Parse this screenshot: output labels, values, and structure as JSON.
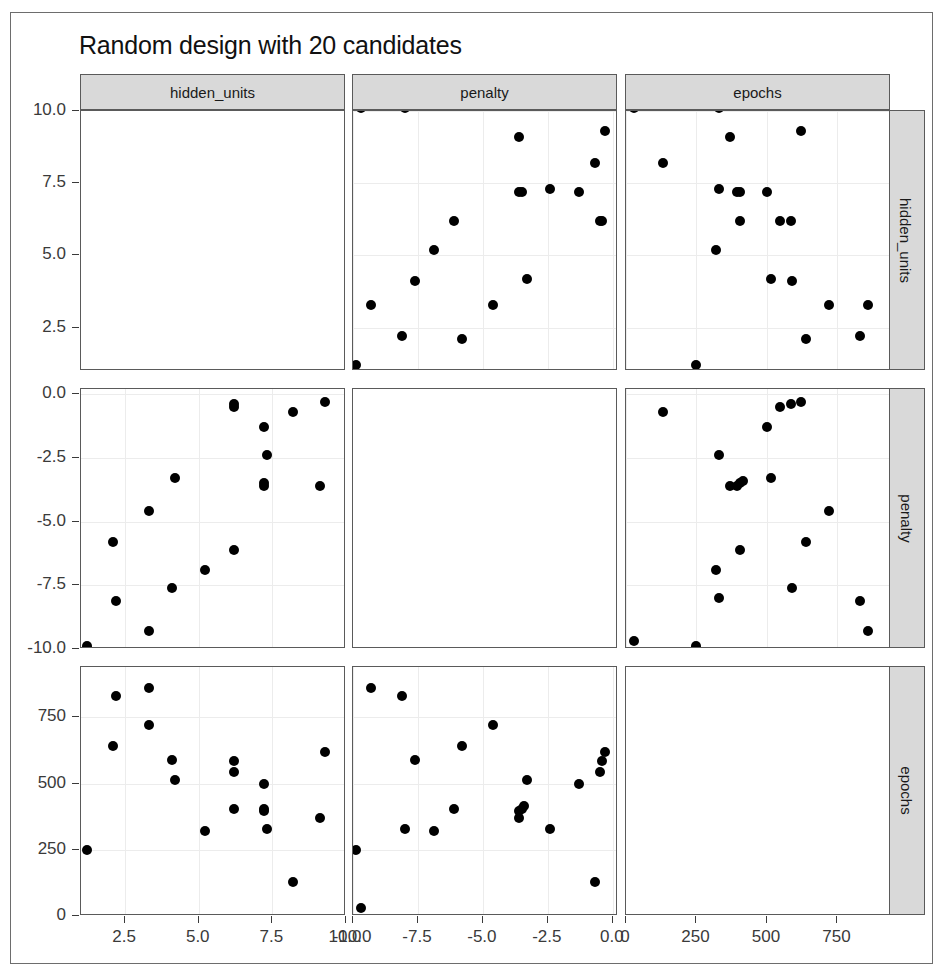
{
  "chart_data": {
    "type": "scatter",
    "title": "Random design with 20 candidates",
    "subtitle": "",
    "layout": "pairs-matrix",
    "grid": true,
    "legend": "none",
    "variables": [
      "hidden_units",
      "penalty",
      "epochs"
    ],
    "column_strips": [
      "hidden_units",
      "penalty",
      "epochs"
    ],
    "row_strips": [
      "hidden_units",
      "penalty",
      "epochs"
    ],
    "axes": {
      "hidden_units": {
        "label": "hidden_units",
        "lim": [
          1,
          10
        ],
        "ticks": [
          2.5,
          5.0,
          7.5,
          10.0
        ],
        "tick_labels": [
          "2.5",
          "5.0",
          "7.5",
          "10.0"
        ]
      },
      "penalty": {
        "label": "penalty",
        "lim": [
          -10,
          0.2
        ],
        "ticks": [
          -10.0,
          -7.5,
          -5.0,
          -2.5,
          0.0
        ],
        "tick_labels": [
          "-10.0",
          "-7.5",
          "-5.0",
          "-2.5",
          "0.0"
        ]
      },
      "epochs": {
        "label": "epochs",
        "lim": [
          0,
          940
        ],
        "ticks": [
          0,
          250,
          500,
          750
        ],
        "tick_labels": [
          "0",
          "250",
          "500",
          "750"
        ]
      }
    },
    "n_points": 20,
    "points": [
      {
        "hidden_units": 10.1,
        "penalty": -9.7,
        "epochs": 30
      },
      {
        "hidden_units": 10.1,
        "penalty": -8.0,
        "epochs": 330
      },
      {
        "hidden_units": 9.1,
        "penalty": -3.6,
        "epochs": 370
      },
      {
        "hidden_units": 10.2,
        "penalty": -3.4,
        "epochs": 415
      },
      {
        "hidden_units": 9.3,
        "penalty": -0.3,
        "epochs": 620
      },
      {
        "hidden_units": 8.2,
        "penalty": -0.7,
        "epochs": 130
      },
      {
        "hidden_units": 7.2,
        "penalty": -3.6,
        "epochs": 395
      },
      {
        "hidden_units": 7.2,
        "penalty": -3.5,
        "epochs": 405
      },
      {
        "hidden_units": 7.3,
        "penalty": -2.4,
        "epochs": 330
      },
      {
        "hidden_units": 7.2,
        "penalty": -1.3,
        "epochs": 500
      },
      {
        "hidden_units": 6.2,
        "penalty": -6.1,
        "epochs": 405
      },
      {
        "hidden_units": 6.2,
        "penalty": -0.5,
        "epochs": 545
      },
      {
        "hidden_units": 6.2,
        "penalty": -0.4,
        "epochs": 585
      },
      {
        "hidden_units": 5.2,
        "penalty": -6.9,
        "epochs": 320
      },
      {
        "hidden_units": 4.2,
        "penalty": -3.3,
        "epochs": 515
      },
      {
        "hidden_units": 4.1,
        "penalty": -7.6,
        "epochs": 590
      },
      {
        "hidden_units": 3.3,
        "penalty": -4.6,
        "epochs": 720
      },
      {
        "hidden_units": 3.3,
        "penalty": -9.3,
        "epochs": 860
      },
      {
        "hidden_units": 2.2,
        "penalty": -8.1,
        "epochs": 830
      },
      {
        "hidden_units": 2.1,
        "penalty": -5.8,
        "epochs": 640
      },
      {
        "hidden_units": 1.2,
        "penalty": -9.9,
        "epochs": 250
      }
    ],
    "panels": [
      {
        "row": 0,
        "col": 0,
        "x": "hidden_units",
        "y": "hidden_units",
        "blank": true
      },
      {
        "row": 0,
        "col": 1,
        "x": "penalty",
        "y": "hidden_units",
        "blank": false
      },
      {
        "row": 0,
        "col": 2,
        "x": "epochs",
        "y": "hidden_units",
        "blank": false
      },
      {
        "row": 1,
        "col": 0,
        "x": "hidden_units",
        "y": "penalty",
        "blank": false
      },
      {
        "row": 1,
        "col": 1,
        "x": "penalty",
        "y": "penalty",
        "blank": true
      },
      {
        "row": 1,
        "col": 2,
        "x": "epochs",
        "y": "penalty",
        "blank": false
      },
      {
        "row": 2,
        "col": 0,
        "x": "hidden_units",
        "y": "epochs",
        "blank": false
      },
      {
        "row": 2,
        "col": 1,
        "x": "penalty",
        "y": "epochs",
        "blank": false
      },
      {
        "row": 2,
        "col": 2,
        "x": "epochs",
        "y": "epochs",
        "blank": true
      }
    ],
    "series_hidden_units_vs_penalty": {
      "name": "hidden_units vs penalty",
      "x": [
        10.1,
        10.1,
        9.1,
        10.2,
        9.3,
        8.2,
        7.2,
        7.2,
        7.3,
        7.2,
        6.2,
        6.2,
        6.2,
        5.2,
        4.2,
        4.1,
        3.3,
        3.3,
        2.2,
        2.1,
        1.2
      ],
      "y": [
        -9.7,
        -8.0,
        -3.6,
        -3.4,
        -0.3,
        -0.7,
        -3.6,
        -3.5,
        -2.4,
        -1.3,
        -6.1,
        -0.5,
        -0.4,
        -6.9,
        -3.3,
        -7.6,
        -4.6,
        -9.3,
        -8.1,
        -5.8,
        -9.9
      ]
    },
    "series_hidden_units_vs_epochs": {
      "name": "hidden_units vs epochs",
      "x": [
        10.1,
        10.1,
        9.1,
        10.2,
        9.3,
        8.2,
        7.2,
        7.2,
        7.3,
        7.2,
        6.2,
        6.2,
        6.2,
        5.2,
        4.2,
        4.1,
        3.3,
        3.3,
        2.2,
        2.1,
        1.2
      ],
      "y": [
        30,
        330,
        370,
        415,
        620,
        130,
        395,
        405,
        330,
        500,
        405,
        545,
        585,
        320,
        515,
        590,
        720,
        860,
        830,
        640,
        250
      ]
    },
    "series_penalty_vs_epochs": {
      "name": "penalty vs epochs",
      "x": [
        -9.7,
        -8.0,
        -3.6,
        -3.4,
        -0.3,
        -0.7,
        -3.6,
        -3.5,
        -2.4,
        -1.3,
        -6.1,
        -0.5,
        -0.4,
        -6.9,
        -3.3,
        -7.6,
        -4.6,
        -9.3,
        -8.1,
        -5.8,
        -9.9
      ],
      "y": [
        30,
        330,
        370,
        415,
        620,
        130,
        395,
        405,
        330,
        500,
        405,
        545,
        585,
        320,
        515,
        590,
        720,
        860,
        830,
        640,
        250
      ]
    }
  },
  "title": "Random design with 20 candidates",
  "strips": {
    "col": [
      "hidden_units",
      "penalty",
      "epochs"
    ],
    "row": [
      "hidden_units",
      "penalty",
      "epochs"
    ]
  },
  "y_axis": {
    "hidden_units": [
      "10.0",
      "7.5",
      "5.0",
      "2.5"
    ],
    "penalty": [
      "0.0",
      "-2.5",
      "-5.0",
      "-7.5",
      "-10.0"
    ],
    "epochs": [
      "750",
      "500",
      "250",
      "0"
    ]
  },
  "x_axis": {
    "hidden_units": [
      "2.5",
      "5.0",
      "7.5",
      "10.0"
    ],
    "penalty": [
      "-10.0",
      "-7.5",
      "-5.0",
      "-2.5",
      "0.0"
    ],
    "epochs": [
      "0",
      "250",
      "500",
      "750"
    ]
  }
}
